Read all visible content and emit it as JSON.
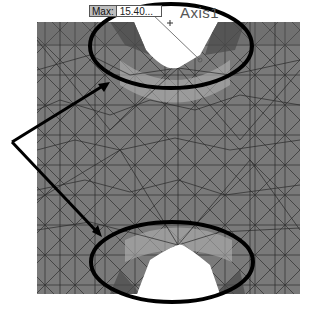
{
  "figure": {
    "max_label": {
      "key": "Max:",
      "value": "15.40..."
    },
    "axis_label": "Axis1",
    "colors": {
      "mesh_fill": "#7a7a7a",
      "mesh_lines": "#2a2a2a",
      "highlight_light": "#b8b8b8",
      "highlight_dark": "#4a4a4a",
      "annotation": "#000000",
      "background": "#ffffff"
    },
    "annotations": [
      {
        "type": "ellipse",
        "region": "top-notch"
      },
      {
        "type": "ellipse",
        "region": "bottom-notch"
      },
      {
        "type": "arrow",
        "from": "left-vertex",
        "to": "top-ellipse"
      },
      {
        "type": "arrow",
        "from": "left-vertex",
        "to": "bottom-ellipse"
      }
    ]
  }
}
